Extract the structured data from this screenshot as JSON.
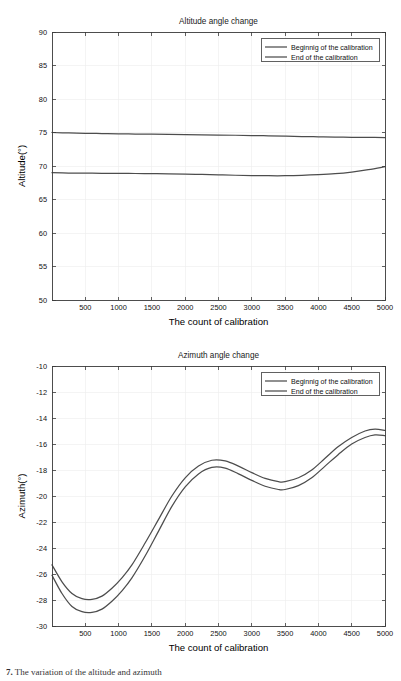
{
  "document": {
    "caption_marker": "7.",
    "caption_text": "The variation of the altitude and azimuth"
  },
  "figures": [
    {
      "id": "altitude",
      "name": "altitude-angle-chart"
    },
    {
      "id": "azimuth",
      "name": "azimuth-angle-chart"
    }
  ],
  "chart_data": [
    {
      "type": "line",
      "id": "altitude",
      "title": "Altitude angle change",
      "xlabel": "The count of calibration",
      "ylabel": "Altitude(°)",
      "xlim": [
        0,
        5000
      ],
      "ylim": [
        50,
        90
      ],
      "xticks": [
        500,
        1000,
        1500,
        2000,
        2500,
        3000,
        3500,
        4000,
        4500,
        5000
      ],
      "xticklabels": [
        "500",
        "1000",
        "1500",
        "2000",
        "2500",
        "3000",
        "3500",
        "4000",
        "4500",
        "5000"
      ],
      "yticks": [
        50,
        55,
        60,
        65,
        70,
        75,
        80,
        85,
        90
      ],
      "yticklabels": [
        "50",
        "55",
        "60",
        "65",
        "70",
        "75",
        "80",
        "85",
        "90"
      ],
      "grid": true,
      "legend_position": "upper right",
      "series": [
        {
          "name": "Beginnig of the calibration",
          "color": "#4d4d4d",
          "x": [
            0,
            250,
            500,
            750,
            1000,
            1250,
            1500,
            1750,
            2000,
            2250,
            2500,
            2750,
            3000,
            3250,
            3500,
            3750,
            4000,
            4250,
            4500,
            4750,
            5000
          ],
          "y": [
            75.0,
            74.93,
            74.88,
            74.84,
            74.8,
            74.77,
            74.74,
            74.71,
            74.68,
            74.65,
            74.62,
            74.59,
            74.55,
            74.5,
            74.45,
            74.4,
            74.36,
            74.32,
            74.29,
            74.26,
            74.25
          ]
        },
        {
          "name": "End of the calibration",
          "color": "#4d4d4d",
          "x": [
            0,
            250,
            500,
            750,
            1000,
            1250,
            1500,
            1750,
            2000,
            2250,
            2500,
            2750,
            3000,
            3250,
            3500,
            3750,
            4000,
            4250,
            4500,
            4750,
            5000
          ],
          "y": [
            69.0,
            68.95,
            68.93,
            68.91,
            68.9,
            68.88,
            68.86,
            68.84,
            68.8,
            68.74,
            68.68,
            68.62,
            68.58,
            68.55,
            68.55,
            68.6,
            68.7,
            68.85,
            69.1,
            69.45,
            69.9
          ]
        }
      ]
    },
    {
      "type": "line",
      "id": "azimuth",
      "title": "Azimuth angle change",
      "xlabel": "The count of calibration",
      "ylabel": "Azimuth(°)",
      "xlim": [
        0,
        5000
      ],
      "ylim": [
        -30,
        -10
      ],
      "xticks": [
        500,
        1000,
        1500,
        2000,
        2500,
        3000,
        3500,
        4000,
        4500,
        5000
      ],
      "xticklabels": [
        "500",
        "1000",
        "1500",
        "2000",
        "2500",
        "3000",
        "3500",
        "4000",
        "4500",
        "5000"
      ],
      "yticks": [
        -30,
        -28,
        -26,
        -24,
        -22,
        -20,
        -18,
        -16,
        -14,
        -12,
        -10
      ],
      "yticklabels": [
        "-30",
        "-28",
        "-26",
        "-24",
        "-22",
        "-20",
        "-18",
        "-16",
        "-14",
        "-12",
        "-10"
      ],
      "grid": true,
      "legend_position": "upper right",
      "series": [
        {
          "name": "Beginnig of the calibration",
          "color": "#4d4d4d",
          "x": [
            0,
            150,
            300,
            450,
            600,
            750,
            900,
            1050,
            1200,
            1400,
            1600,
            1800,
            2000,
            2200,
            2400,
            2600,
            2800,
            3000,
            3200,
            3400,
            3500,
            3700,
            3900,
            4100,
            4300,
            4500,
            4700,
            4850,
            5000
          ],
          "y": [
            -25.3,
            -26.6,
            -27.5,
            -27.9,
            -27.95,
            -27.7,
            -27.1,
            -26.3,
            -25.3,
            -23.6,
            -21.8,
            -20.0,
            -18.6,
            -17.7,
            -17.25,
            -17.3,
            -17.7,
            -18.2,
            -18.65,
            -18.9,
            -18.9,
            -18.6,
            -18.0,
            -17.1,
            -16.2,
            -15.5,
            -15.0,
            -14.85,
            -14.95
          ]
        },
        {
          "name": "End of the calibration",
          "color": "#4d4d4d",
          "x": [
            0,
            150,
            300,
            450,
            600,
            750,
            900,
            1050,
            1200,
            1400,
            1600,
            1800,
            2000,
            2200,
            2400,
            2600,
            2800,
            3000,
            3200,
            3400,
            3500,
            3700,
            3900,
            4100,
            4300,
            4500,
            4700,
            4850,
            5000
          ],
          "y": [
            -26.1,
            -27.5,
            -28.5,
            -28.9,
            -28.95,
            -28.7,
            -28.1,
            -27.3,
            -26.3,
            -24.6,
            -22.7,
            -20.8,
            -19.3,
            -18.3,
            -17.8,
            -17.85,
            -18.3,
            -18.8,
            -19.25,
            -19.5,
            -19.5,
            -19.2,
            -18.6,
            -17.7,
            -16.8,
            -16.0,
            -15.5,
            -15.3,
            -15.35
          ]
        }
      ]
    }
  ]
}
